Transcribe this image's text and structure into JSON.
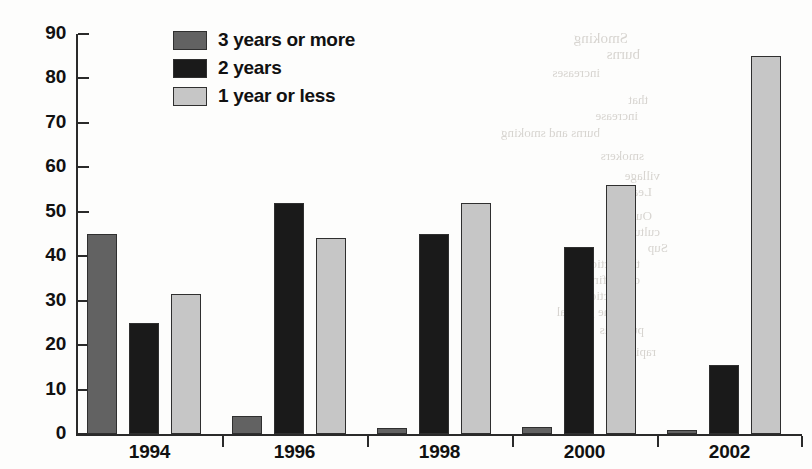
{
  "chart_data": {
    "type": "bar",
    "title": "",
    "xlabel": "",
    "ylabel": "",
    "categories": [
      "1994",
      "1996",
      "1998",
      "2000",
      "2002"
    ],
    "ylim": [
      0,
      90
    ],
    "yticks": [
      0,
      10,
      20,
      30,
      40,
      50,
      60,
      70,
      80,
      90
    ],
    "grid": false,
    "legend_position": "top-center",
    "series": [
      {
        "name": "3 years or more",
        "color": "#626262",
        "values": [
          45,
          4,
          1.3,
          1.5,
          1
        ]
      },
      {
        "name": "2 years",
        "color": "#1a1a1a",
        "values": [
          25,
          52,
          45,
          42,
          15.5
        ]
      },
      {
        "name": "1 year or less",
        "color": "#c6c6c6",
        "values": [
          31.5,
          44,
          52,
          56,
          85
        ]
      }
    ]
  },
  "legend": {
    "items": [
      {
        "label": "3 years or more",
        "swatch": "#626262"
      },
      {
        "label": "2 years",
        "swatch": "#1a1a1a"
      },
      {
        "label": "1 year or less",
        "swatch": "#c6c6c6"
      }
    ]
  },
  "axes": {
    "y_tick_labels": [
      "90",
      "80",
      "70",
      "60",
      "50",
      "40",
      "30",
      "20",
      "10",
      "0"
    ],
    "x_tick_labels": [
      "1994",
      "1996",
      "1998",
      "2000",
      "2002"
    ]
  },
  "background_bleed": {
    "lines": [
      {
        "text": "Smoking",
        "x": 628,
        "y": 30,
        "size": 15
      },
      {
        "text": "burns",
        "x": 640,
        "y": 46,
        "size": 15
      },
      {
        "text": "increases",
        "x": 600,
        "y": 65,
        "size": 13
      },
      {
        "text": "that",
        "x": 648,
        "y": 92,
        "size": 13
      },
      {
        "text": "increase",
        "x": 638,
        "y": 108,
        "size": 13
      },
      {
        "text": "burns and smoking",
        "x": 600,
        "y": 125,
        "size": 13
      },
      {
        "text": "smokers",
        "x": 644,
        "y": 148,
        "size": 13
      },
      {
        "text": "village",
        "x": 660,
        "y": 168,
        "size": 13
      },
      {
        "text": "Lead a",
        "x": 652,
        "y": 184,
        "size": 13
      },
      {
        "text": "Outlines",
        "x": 652,
        "y": 208,
        "size": 13
      },
      {
        "text": "culture",
        "x": 660,
        "y": 224,
        "size": 13
      },
      {
        "text": "Sup",
        "x": 668,
        "y": 240,
        "size": 13
      },
      {
        "text": "the section",
        "x": 640,
        "y": 256,
        "size": 13
      },
      {
        "text": "of the fire",
        "x": 640,
        "y": 272,
        "size": 13
      },
      {
        "text": "protection",
        "x": 636,
        "y": 288,
        "size": 13
      },
      {
        "text": "of the general",
        "x": 628,
        "y": 304,
        "size": 13
      },
      {
        "text": "public is",
        "x": 644,
        "y": 322,
        "size": 13
      },
      {
        "text": "rapid",
        "x": 656,
        "y": 344,
        "size": 13
      }
    ]
  }
}
